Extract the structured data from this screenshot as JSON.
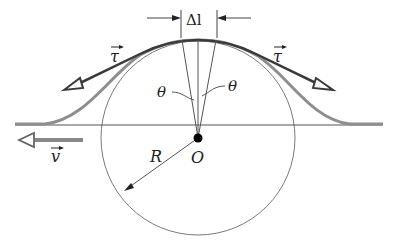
{
  "diagram": {
    "labels": {
      "delta_l": "Δl",
      "tau_left": "τ",
      "tau_right": "τ",
      "theta_left": "θ",
      "theta_right": "θ",
      "velocity": "v",
      "radius": "R",
      "center": "O"
    },
    "colors": {
      "rope": "#8a8a8a",
      "tension_vector": "#3a3a3a",
      "circle": "#777777",
      "line": "#555555",
      "center_dot": "#000000"
    }
  }
}
